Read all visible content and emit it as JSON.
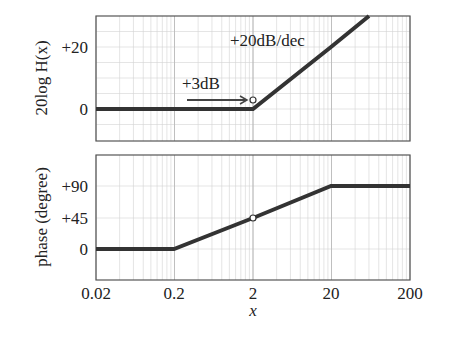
{
  "chart_data": [
    {
      "type": "line",
      "title": "",
      "xlabel": "",
      "ylabel": "20log H(x)",
      "xscale": "log",
      "xlim": [
        0.02,
        200
      ],
      "ylim": [
        -10,
        30
      ],
      "yticks": [
        "+20",
        "0"
      ],
      "ytick_values": [
        20,
        0
      ],
      "grid": true,
      "series": [
        {
          "name": "magnitude asymptote",
          "x": [
            0.02,
            0.2,
            2,
            20,
            60
          ],
          "y": [
            0,
            0,
            0,
            20,
            29.5
          ]
        }
      ],
      "annotations": [
        {
          "text": "+20dB/dec",
          "x": 20,
          "y": 25
        },
        {
          "text": "+3dB",
          "x": 0.5,
          "y": 7,
          "arrow_to": [
            2,
            3
          ]
        }
      ],
      "markers": [
        {
          "x": 2,
          "y": 3,
          "style": "open-circle"
        }
      ]
    },
    {
      "type": "line",
      "title": "",
      "xlabel": "x",
      "ylabel": "phase (degree)",
      "xscale": "log",
      "xlim": [
        0.02,
        200
      ],
      "ylim": [
        -45,
        135
      ],
      "xticks": [
        "0.02",
        "0.2",
        "2",
        "20",
        "200"
      ],
      "yticks": [
        "+90",
        "+45",
        "0"
      ],
      "ytick_values": [
        90,
        45,
        0
      ],
      "grid": true,
      "series": [
        {
          "name": "phase asymptote",
          "x": [
            0.02,
            0.2,
            2,
            20,
            200
          ],
          "y": [
            0,
            0,
            45,
            90,
            90
          ]
        }
      ],
      "markers": [
        {
          "x": 2,
          "y": 45,
          "style": "open-circle"
        }
      ]
    }
  ],
  "top": {
    "ylabel": "20log H(x)",
    "yticks": [
      "+20",
      "0"
    ],
    "slope_label": "+20dB/dec",
    "marker_label": "+3dB"
  },
  "bottom": {
    "ylabel": "phase (degree)",
    "yticks": [
      "+90",
      "+45",
      "0"
    ],
    "xticks": [
      "0.02",
      "0.2",
      "2",
      "20",
      "200"
    ],
    "xlabel": "x"
  }
}
